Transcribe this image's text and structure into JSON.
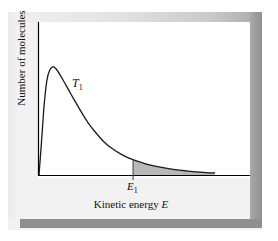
{
  "figure": {
    "ylabel": "Number of molecules",
    "xlabel_text": "Kinetic energy ",
    "xlabel_symbol": "E",
    "curve_label": "T",
    "curve_label_sub": "1",
    "energy_label": "E",
    "energy_label_sub": "1"
  },
  "colors": {
    "curve": "#1a1a1a",
    "axis": "#000000",
    "panel": "#ffffff",
    "outer_panel": "#f2f2f2",
    "shade": "#b4b4b4",
    "bottom_bar": "#8e8e8e",
    "right_bar": "#9a9a9a"
  },
  "chart_data": {
    "type": "line",
    "title": "",
    "xlabel": "Kinetic energy E",
    "ylabel": "Number of molecules",
    "grid": false,
    "legend": false,
    "axis_ticks": false,
    "xlim": [
      0,
      1
    ],
    "ylim": [
      0,
      1
    ],
    "annotations": [
      {
        "text": "T1",
        "x": 0.17,
        "y": 0.66,
        "note": "curve label, temperature T sub 1"
      },
      {
        "text": "E1",
        "x": 0.45,
        "y": -0.05,
        "note": "activation energy marker on x-axis"
      }
    ],
    "shaded_region": {
      "label": "E1",
      "x_start": 0.45,
      "x_end": 0.84,
      "note": "area under curve beyond E1, molecules with sufficient energy"
    },
    "series": [
      {
        "name": "T1",
        "x": [
          0.0,
          0.012,
          0.025,
          0.038,
          0.05,
          0.065,
          0.08,
          0.1,
          0.12,
          0.145,
          0.17,
          0.2,
          0.235,
          0.27,
          0.31,
          0.35,
          0.39,
          0.43,
          0.47,
          0.51,
          0.555,
          0.6,
          0.65,
          0.7,
          0.75,
          0.8,
          0.84
        ],
        "y": [
          0.0,
          0.3,
          0.64,
          0.855,
          0.94,
          0.975,
          0.96,
          0.905,
          0.84,
          0.755,
          0.672,
          0.575,
          0.47,
          0.385,
          0.3,
          0.238,
          0.19,
          0.152,
          0.124,
          0.101,
          0.08,
          0.064,
          0.049,
          0.038,
          0.029,
          0.022,
          0.018
        ]
      }
    ]
  }
}
